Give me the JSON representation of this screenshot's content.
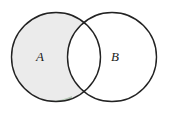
{
  "figure": {
    "name": "two-set-venn-diagram",
    "type": "venn",
    "width": 170,
    "height": 115,
    "background_color": "#ffffff"
  },
  "style": {
    "outline_color": "#222222",
    "outline_width": 1.4,
    "shaded_fill": "#ebebeb",
    "unshaded_fill": "#ffffff",
    "label_color": "#1a1a1a",
    "accent_tint": "#8fae8f"
  },
  "sets": [
    {
      "id": "A",
      "label": "A",
      "cx": 56,
      "cy": 57,
      "r": 44.5,
      "shaded": true,
      "label_x": 40,
      "label_y": 58
    },
    {
      "id": "B",
      "label": "B",
      "cx": 112,
      "cy": 57,
      "r": 44.5,
      "shaded": false,
      "label_x": 115,
      "label_y": 58
    }
  ],
  "regions": {
    "a_only": {
      "name": "A-minus-B",
      "fill": "#ebebeb",
      "shaded": true
    },
    "intersection": {
      "name": "A-intersect-B",
      "fill": "#ffffff",
      "shaded": false
    },
    "b_only": {
      "name": "B-minus-A",
      "fill": "#ffffff",
      "shaded": false
    }
  }
}
